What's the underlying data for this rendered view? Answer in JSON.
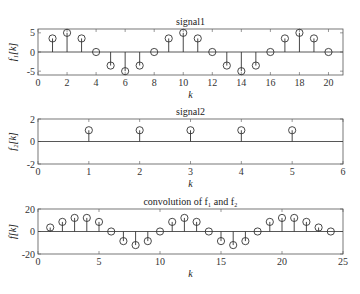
{
  "chart_data": [
    {
      "type": "stem",
      "title": "signal1",
      "xlabel": "k",
      "ylabel": "f1[k]",
      "xlim": [
        0,
        21
      ],
      "ylim": [
        -6,
        6
      ],
      "xticks": [
        0,
        2,
        4,
        6,
        8,
        10,
        12,
        14,
        16,
        18,
        20
      ],
      "yticks": [
        -5,
        0,
        5
      ],
      "x": [
        1,
        2,
        3,
        4,
        5,
        6,
        7,
        8,
        9,
        10,
        11,
        12,
        13,
        14,
        15,
        16,
        17,
        18,
        19,
        20
      ],
      "values": [
        3.54,
        5,
        3.54,
        0,
        -3.54,
        -5,
        -3.54,
        0,
        3.54,
        5,
        3.54,
        0,
        -3.54,
        -5,
        -3.54,
        0,
        3.54,
        5,
        3.54,
        0
      ],
      "grid": false
    },
    {
      "type": "stem",
      "title": "signal2",
      "xlabel": "k",
      "ylabel": "f2[k]",
      "xlim": [
        0,
        6
      ],
      "ylim": [
        -2,
        2
      ],
      "xticks": [
        0,
        1,
        2,
        3,
        4,
        5,
        6
      ],
      "yticks": [
        -2,
        0,
        2
      ],
      "x": [
        1,
        2,
        3,
        4,
        5
      ],
      "values": [
        1,
        1,
        1,
        1,
        1
      ],
      "grid": false
    },
    {
      "type": "stem",
      "title": "convolution of f1 and f2",
      "xlabel": "k",
      "ylabel": "f[k]",
      "xlim": [
        0,
        25
      ],
      "ylim": [
        -20,
        20
      ],
      "xticks": [
        0,
        5,
        10,
        15,
        20,
        25
      ],
      "yticks": [
        -20,
        0,
        20
      ],
      "x": [
        1,
        2,
        3,
        4,
        5,
        6,
        7,
        8,
        9,
        10,
        11,
        12,
        13,
        14,
        15,
        16,
        17,
        18,
        19,
        20,
        21,
        22,
        23,
        24
      ],
      "values": [
        3.54,
        8.54,
        12.07,
        12.07,
        8.54,
        0,
        -8.54,
        -12.07,
        -8.54,
        0,
        8.54,
        12.07,
        8.54,
        0,
        -8.54,
        -12.07,
        -8.54,
        0,
        8.54,
        12.07,
        12.07,
        8.54,
        3.54,
        0
      ],
      "grid": false
    }
  ],
  "layout": [
    {
      "left": 38,
      "right": 343,
      "top": 29,
      "bottom": 75
    },
    {
      "left": 38,
      "right": 343,
      "top": 119,
      "bottom": 164
    },
    {
      "left": 38,
      "right": 343,
      "top": 209,
      "bottom": 254
    }
  ],
  "labels": {
    "p1_title": "signal1",
    "p2_title": "signal2",
    "p3_title": "convolution of f₁ and f₂",
    "xlabel": "k",
    "p1_ylab": "f₁[k]",
    "p2_ylab": "f₂[k]",
    "p3_ylab": "f[k]"
  }
}
